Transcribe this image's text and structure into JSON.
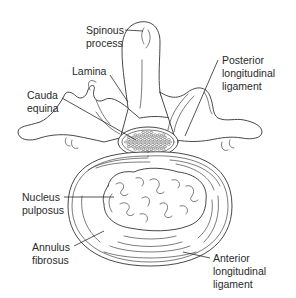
{
  "diagram": {
    "labels": {
      "spinous_process": [
        "Spinous",
        "process"
      ],
      "lamina": [
        "Lamina"
      ],
      "cauda_equina": [
        "Cauda",
        "equina"
      ],
      "posterior_longitudinal_ligament": [
        "Posterior",
        "longitudinal",
        "ligament"
      ],
      "nucleus_pulposus": [
        "Nucleus",
        "pulposus"
      ],
      "annulus_fibrosus": [
        "Annulus",
        "fibrosus"
      ],
      "anterior_longitudinal_ligament": [
        "Anterior",
        "longitudinal",
        "ligament"
      ]
    }
  }
}
